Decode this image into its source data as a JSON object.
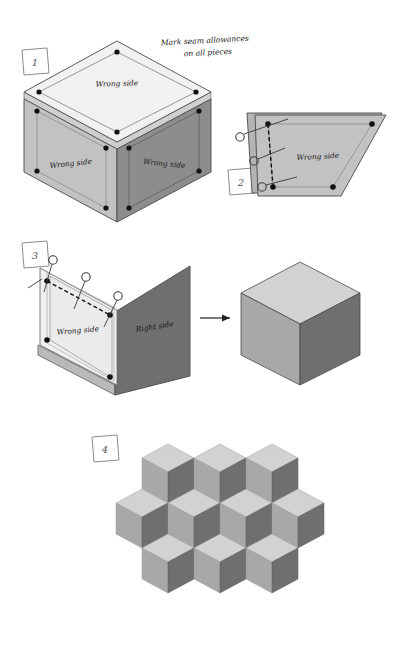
{
  "page": {
    "background_color": "#ffffff",
    "width": 397,
    "height": 649
  },
  "annotation": {
    "caption_line1": "Mark seam allowances",
    "caption_line2": "on all pieces"
  },
  "labels": {
    "wrong_side": "Wrong side",
    "right_side": "Right side"
  },
  "steps": [
    {
      "number": "1",
      "name": "mark-seam-allowances",
      "caption": "Mark seam allowances on all pieces",
      "face_labels": [
        "Wrong side",
        "Wrong side",
        "Wrong side"
      ],
      "corner_dots": 12,
      "description": "Three diamond pieces shown as an exploded cube, all wrong side up with seam allowance lines and corner dots marked."
    },
    {
      "number": "2",
      "name": "stitch-first-seam",
      "piece_label": "Wrong side",
      "pins": 3,
      "corner_dots": 4,
      "description": "Two diamonds placed right sides together, pinned along one edge, stitched on the marked dashed line between corner dots."
    },
    {
      "number": "3",
      "name": "set-in-third-diamond",
      "piece_labels": [
        "Wrong side",
        "Right side"
      ],
      "pins": 3,
      "corner_dots": 4,
      "result": "Completed cube block",
      "description": "Third diamond set into the angle, pinned and stitched dot to dot, producing the finished cube."
    },
    {
      "number": "4",
      "name": "join-blocks-into-pattern",
      "layout": {
        "rows": [
          {
            "row": 1,
            "cubes": 3
          },
          {
            "row": 2,
            "cubes": 4
          },
          {
            "row": 3,
            "cubes": 3
          }
        ],
        "total_cubes": 10
      },
      "description": "Finished cube blocks joined into the tumbling blocks tessellation."
    }
  ],
  "colors": {
    "face_top_light": "#d9d9d9",
    "face_left_medium": "#a8a8a8",
    "face_right_dark": "#6f6f6f",
    "piece_pale": "#f1f1f1",
    "piece_mid": "#c2c2c2",
    "piece_dark": "#8d8d8d",
    "outline": "#4a4a4a",
    "dot": "#111111",
    "stitch_line": "#111111",
    "pin_circle": "#3a3a3a",
    "step_box": "#888888",
    "arrow": "#222222"
  },
  "icons": {
    "step_box": "hand-drawn-square",
    "pin": "pin-circle-icon",
    "dot": "corner-dot-icon",
    "arrow": "arrow-right-icon"
  }
}
